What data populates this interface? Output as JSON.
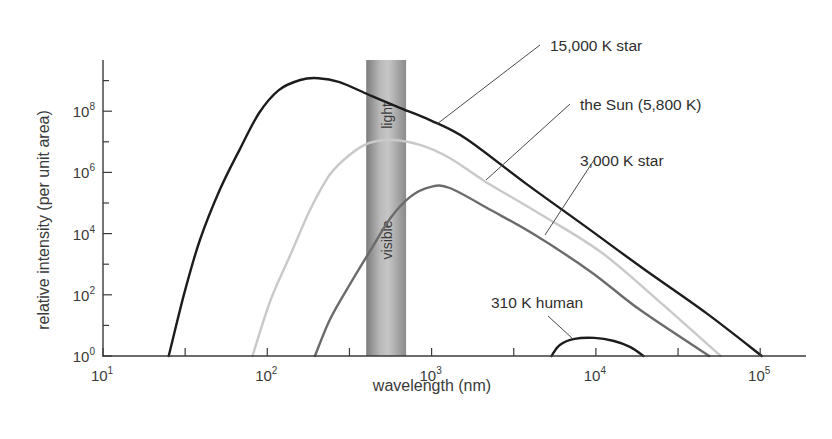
{
  "chart_data": {
    "type": "line",
    "title": "",
    "xlabel": "wavelength (nm)",
    "ylabel": "relative intensity (per unit area)",
    "x_scale": "log",
    "y_scale": "log",
    "xlim_log10": [
      1,
      5.28
    ],
    "ylim_log10": [
      0,
      9.7
    ],
    "x_ticks": [
      {
        "base": "10",
        "exp": "1",
        "log10": 1
      },
      {
        "base": "10",
        "exp": "2",
        "log10": 2
      },
      {
        "base": "10",
        "exp": "3",
        "log10": 3
      },
      {
        "base": "10",
        "exp": "4",
        "log10": 4
      },
      {
        "base": "10",
        "exp": "5",
        "log10": 5
      }
    ],
    "x_minor_ticks_log10": [
      1.5,
      2.5,
      3.5,
      4.5
    ],
    "y_ticks": [
      {
        "base": "10",
        "exp": "0",
        "log10": 0
      },
      {
        "base": "10",
        "exp": "2",
        "log10": 2
      },
      {
        "base": "10",
        "exp": "4",
        "log10": 4
      },
      {
        "base": "10",
        "exp": "6",
        "log10": 6
      },
      {
        "base": "10",
        "exp": "8",
        "log10": 8
      }
    ],
    "y_minor_ticks_log10": [
      1,
      3,
      5,
      7,
      9
    ],
    "grid": false,
    "legend": "none (curves labeled directly with leader lines)",
    "annotations": [
      {
        "text_top": "light",
        "text_bottom": "visible",
        "kind": "vertical band",
        "x_range_nm": [
          400,
          700
        ]
      }
    ],
    "series": [
      {
        "name": "15,000 K star",
        "color": "#1c1c1c",
        "width": 2.4,
        "peak_wavelength_nm": 200,
        "points_log10": [
          [
            1.4,
            0.0
          ],
          [
            1.5,
            2.16
          ],
          [
            1.59,
            3.79
          ],
          [
            1.71,
            5.42
          ],
          [
            1.83,
            6.73
          ],
          [
            1.95,
            7.94
          ],
          [
            2.07,
            8.69
          ],
          [
            2.2,
            9.02
          ],
          [
            2.31,
            9.08
          ],
          [
            2.44,
            8.95
          ],
          [
            2.62,
            8.53
          ],
          [
            2.81,
            8.1
          ],
          [
            2.99,
            7.71
          ],
          [
            3.21,
            7.1
          ],
          [
            3.57,
            5.65
          ],
          [
            3.94,
            4.22
          ],
          [
            4.3,
            2.81
          ],
          [
            4.67,
            1.41
          ],
          [
            5.01,
            0.0
          ]
        ],
        "label": {
          "x": 550,
          "y": 51,
          "leader": [
            [
              437,
              124
            ],
            [
              540,
              45
            ]
          ]
        }
      },
      {
        "name": "the Sun (5,800 K)",
        "color": "#c9c9c9",
        "width": 2.4,
        "peak_wavelength_nm": 570,
        "points_log10": [
          [
            1.91,
            0.0
          ],
          [
            2.02,
            1.83
          ],
          [
            2.14,
            3.3
          ],
          [
            2.26,
            4.77
          ],
          [
            2.38,
            5.92
          ],
          [
            2.5,
            6.57
          ],
          [
            2.62,
            6.96
          ],
          [
            2.76,
            7.06
          ],
          [
            2.93,
            6.9
          ],
          [
            3.11,
            6.47
          ],
          [
            3.33,
            5.69
          ],
          [
            3.66,
            4.64
          ],
          [
            4.03,
            3.4
          ],
          [
            4.39,
            1.76
          ],
          [
            4.76,
            0.0
          ]
        ],
        "label": {
          "x": 580,
          "y": 110,
          "leader": [
            [
              486,
              180
            ],
            [
              570,
              104
            ]
          ]
        }
      },
      {
        "name": "3,000 K star",
        "color": "#6b6b6b",
        "width": 2.4,
        "peak_wavelength_nm": 980,
        "points_log10": [
          [
            2.29,
            0.0
          ],
          [
            2.38,
            1.18
          ],
          [
            2.5,
            2.32
          ],
          [
            2.64,
            3.56
          ],
          [
            2.75,
            4.51
          ],
          [
            2.87,
            5.2
          ],
          [
            2.99,
            5.52
          ],
          [
            3.11,
            5.49
          ],
          [
            3.36,
            4.77
          ],
          [
            3.63,
            3.95
          ],
          [
            3.97,
            2.75
          ],
          [
            4.27,
            1.5
          ],
          [
            4.69,
            0.0
          ]
        ],
        "label": {
          "x": 580,
          "y": 166,
          "leader": [
            [
              545,
              235
            ],
            [
              594,
              160
            ]
          ]
        }
      },
      {
        "name": "310 K human",
        "color": "#1c1c1c",
        "width": 2.4,
        "peak_wavelength_nm": 9800,
        "points_log10": [
          [
            3.73,
            0.0
          ],
          [
            3.78,
            0.36
          ],
          [
            3.87,
            0.56
          ],
          [
            3.99,
            0.59
          ],
          [
            4.11,
            0.49
          ],
          [
            4.21,
            0.29
          ],
          [
            4.29,
            0.0
          ]
        ],
        "label": {
          "x": 491,
          "y": 308,
          "leader": [
            [
              548,
              316
            ],
            [
              573,
              339
            ]
          ]
        }
      }
    ]
  },
  "plot_area": {
    "x0": 103,
    "decade_px": 164.3,
    "y0": 356,
    "decade_px_y": 30.6,
    "x_end": 806,
    "y_top": 60
  }
}
